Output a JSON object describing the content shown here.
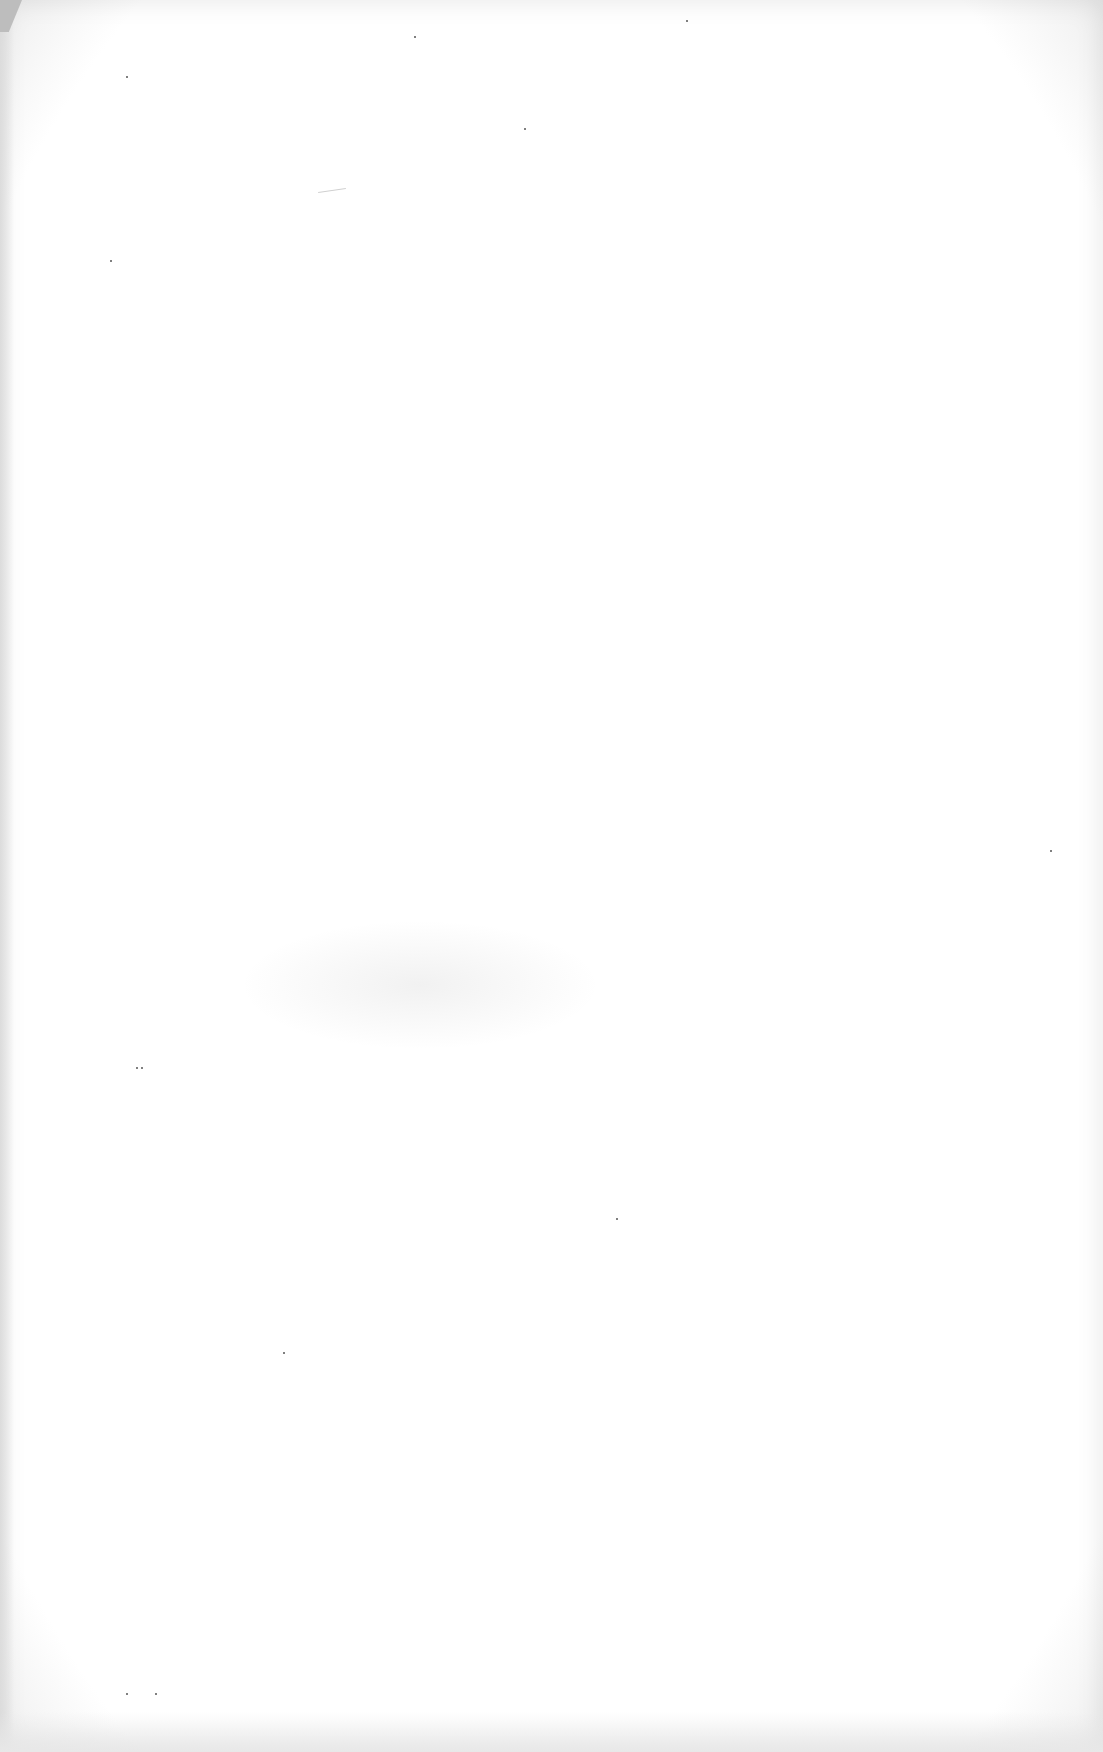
{
  "document": {
    "type": "blank scanned page",
    "text_content": ""
  }
}
